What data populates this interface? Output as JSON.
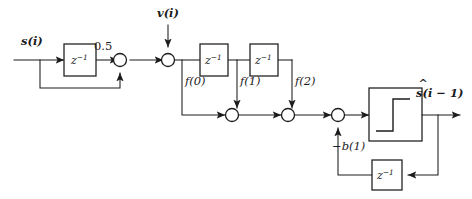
{
  "diagram": {
    "background_color": "#ffffff",
    "line_color": "#1c1c1c",
    "signals": {
      "input": "s(i)",
      "noise": "v(i)",
      "output": "s(i − 1)",
      "output_hat_accent": "^"
    },
    "gains": {
      "forward_gain": "0.5",
      "feedback_gain": "−b(1)"
    },
    "delay_blocks": [
      {
        "id": "delay-input",
        "label_base": "z",
        "label_exponent": "−1"
      },
      {
        "id": "delay-tap-1",
        "label_base": "z",
        "label_exponent": "−1"
      },
      {
        "id": "delay-tap-2",
        "label_base": "z",
        "label_exponent": "−1"
      },
      {
        "id": "delay-feedback",
        "label_base": "z",
        "label_exponent": "−1"
      }
    ],
    "tap_labels": [
      {
        "id": "tap-f0",
        "label": "f(0)"
      },
      {
        "id": "tap-f1",
        "label": "f(1)"
      },
      {
        "id": "tap-f2",
        "label": "f(2)"
      }
    ],
    "nonlinearity": {
      "id": "sign-detector",
      "symbol_name": "step-function-glyph"
    },
    "summing_junctions": [
      {
        "id": "sum-input-feedback"
      },
      {
        "id": "sum-noise"
      },
      {
        "id": "sum-tap-1"
      },
      {
        "id": "sum-tap-2"
      },
      {
        "id": "sum-decision-feedback"
      }
    ]
  }
}
